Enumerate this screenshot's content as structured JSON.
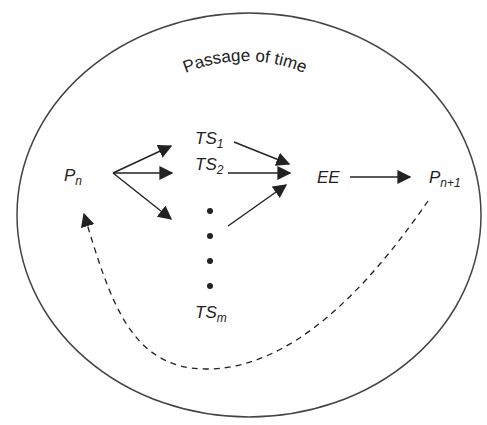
{
  "diagram": {
    "title": "Passage of time",
    "nodes": {
      "pn": {
        "base": "P",
        "sub": "n"
      },
      "ts1": {
        "base": "TS",
        "sub": "1"
      },
      "ts2": {
        "base": "TS",
        "sub": "2"
      },
      "tsm": {
        "base": "TS",
        "sub": "m"
      },
      "ee": {
        "base": "EE",
        "sub": ""
      },
      "pn1": {
        "base": "P",
        "sub": "n+1"
      }
    },
    "edges": [
      {
        "from": "P_n",
        "to": "TS_1"
      },
      {
        "from": "P_n",
        "to": "TS_2"
      },
      {
        "from": "P_n",
        "to": "TS_m"
      },
      {
        "from": "TS_1",
        "to": "EE"
      },
      {
        "from": "TS_2",
        "to": "EE"
      },
      {
        "from": "TS_m",
        "to": "EE"
      },
      {
        "from": "EE",
        "to": "P_n+1"
      },
      {
        "from": "P_n+1",
        "to": "P_n",
        "style": "dashed"
      }
    ],
    "colors": {
      "stroke": "#222222",
      "background": "#ffffff"
    }
  }
}
